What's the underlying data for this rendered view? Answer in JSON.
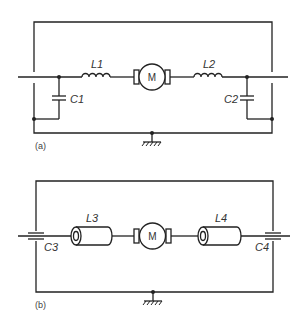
{
  "diagram": {
    "type": "circuit-schematic",
    "panels": [
      {
        "id": "a",
        "caption": "(a)",
        "components": [
          {
            "ref": "L1",
            "label": "L1",
            "kind": "inductor-coil"
          },
          {
            "ref": "M",
            "label": "M",
            "kind": "dc-motor"
          },
          {
            "ref": "L2",
            "label": "L2",
            "kind": "inductor-coil"
          },
          {
            "ref": "C1",
            "label": "C1",
            "kind": "capacitor-shunt"
          },
          {
            "ref": "C2",
            "label": "C2",
            "kind": "capacitor-shunt"
          },
          {
            "ref": "GND",
            "label": "",
            "kind": "chassis-ground"
          }
        ]
      },
      {
        "id": "b",
        "caption": "(b)",
        "components": [
          {
            "ref": "L3",
            "label": "L3",
            "kind": "ferrite-bead-inductor"
          },
          {
            "ref": "M",
            "label": "M",
            "kind": "dc-motor"
          },
          {
            "ref": "L4",
            "label": "L4",
            "kind": "ferrite-bead-inductor"
          },
          {
            "ref": "C3",
            "label": "C3",
            "kind": "feedthrough-capacitor"
          },
          {
            "ref": "C4",
            "label": "C4",
            "kind": "feedthrough-capacitor"
          },
          {
            "ref": "GND",
            "label": "",
            "kind": "chassis-ground"
          }
        ]
      }
    ]
  },
  "labels": {
    "a": {
      "L1": "L1",
      "L2": "L2",
      "C1": "C1",
      "C2": "C2",
      "M": "M",
      "caption": "(a)"
    },
    "b": {
      "L3": "L3",
      "L4": "L4",
      "C3": "C3",
      "C4": "C4",
      "M": "M",
      "caption": "(b)"
    }
  }
}
